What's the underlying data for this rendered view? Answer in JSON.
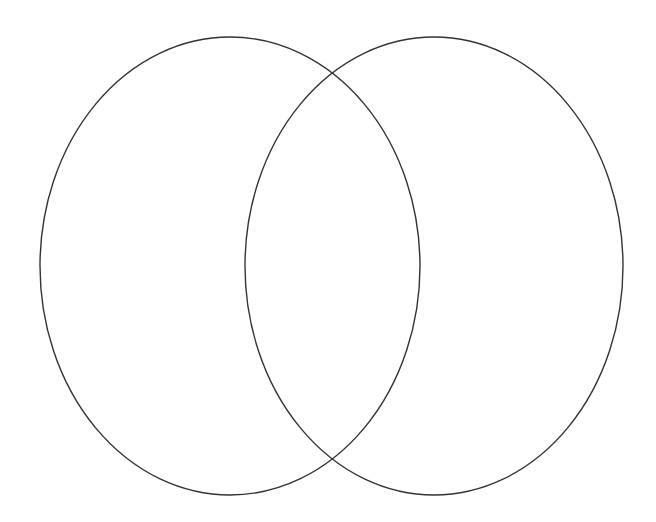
{
  "diagram": {
    "type": "venn",
    "set_count": 2,
    "stroke_color": "#333333",
    "background_color": "#ffffff",
    "sets": [
      {
        "id": "left",
        "label": "",
        "cx": 230,
        "cy": 266,
        "rx": 190,
        "ry": 229
      },
      {
        "id": "right",
        "label": "",
        "cx": 434,
        "cy": 266,
        "rx": 189,
        "ry": 229
      }
    ],
    "intersection_label": ""
  }
}
